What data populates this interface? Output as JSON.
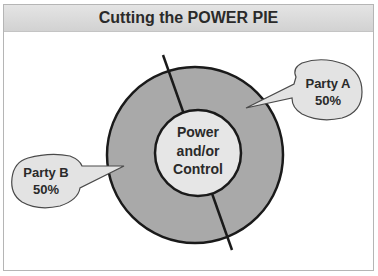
{
  "title": "Cutting the POWER PIE",
  "center": {
    "lines": [
      "Power",
      "and/or",
      "Control"
    ]
  },
  "parties": [
    {
      "name": "Party A",
      "share": "50%"
    },
    {
      "name": "Party B",
      "share": "50%"
    }
  ],
  "colors": {
    "ring": "#a9a9a9",
    "center": "#e6e6e6",
    "bubble": "#e3e3e3",
    "stroke": "#1a1a1a"
  }
}
